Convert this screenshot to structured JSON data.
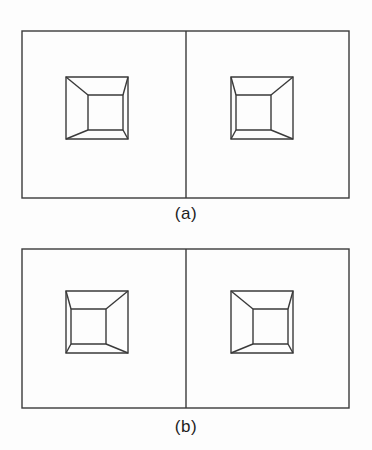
{
  "document": {
    "kind": "scanned-figure",
    "background_color": "#fdfdfd",
    "line_color": "#3a3a3a",
    "text_color": "#1e1e1e",
    "width": 372,
    "height": 450
  },
  "panels": [
    {
      "id": "panel-a",
      "caption": "(a)",
      "frame": {
        "x": 22,
        "y": 31,
        "width": 327,
        "height": 167
      },
      "divider_x": 186,
      "cells": [
        {
          "id": "panel-a-cell-left",
          "shape": "truncated-pyramid-wireframe",
          "vanishing_direction": "right",
          "outer_square": {
            "x": 66,
            "y": 77,
            "size": 62
          },
          "inner_square": {
            "x": 88,
            "y": 95,
            "size": 35
          }
        },
        {
          "id": "panel-a-cell-right",
          "shape": "truncated-pyramid-wireframe",
          "vanishing_direction": "left",
          "outer_square": {
            "x": 231,
            "y": 77,
            "size": 62
          },
          "inner_square": {
            "x": 236,
            "y": 95,
            "size": 35
          }
        }
      ]
    },
    {
      "id": "panel-b",
      "caption": "(b)",
      "frame": {
        "x": 22,
        "y": 249,
        "width": 327,
        "height": 159
      },
      "divider_x": 186,
      "cells": [
        {
          "id": "panel-b-cell-left",
          "shape": "truncated-pyramid-wireframe",
          "vanishing_direction": "left",
          "outer_square": {
            "x": 66,
            "y": 291,
            "size": 62
          },
          "inner_square": {
            "x": 71,
            "y": 309,
            "size": 35
          }
        },
        {
          "id": "panel-b-cell-right",
          "shape": "truncated-pyramid-wireframe",
          "vanishing_direction": "right",
          "outer_square": {
            "x": 231,
            "y": 291,
            "size": 62
          },
          "inner_square": {
            "x": 253,
            "y": 309,
            "size": 35
          }
        }
      ]
    }
  ]
}
